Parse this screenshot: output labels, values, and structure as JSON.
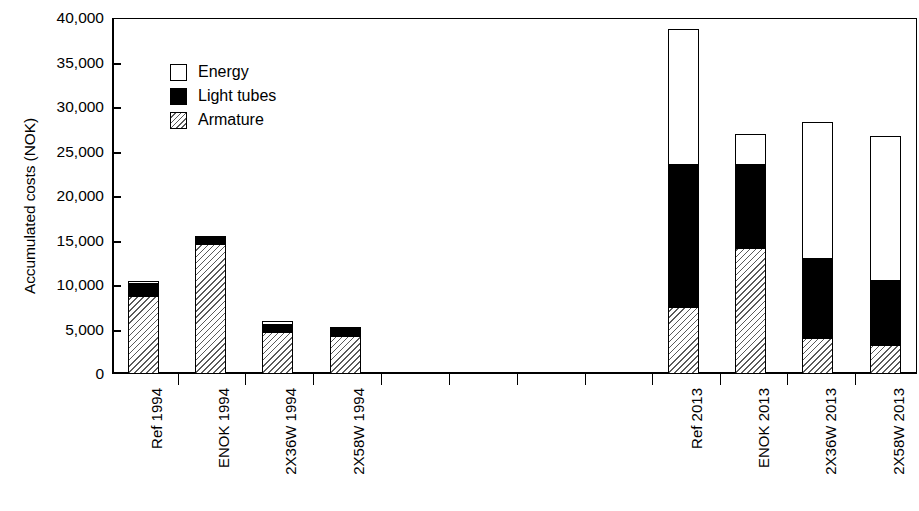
{
  "chart_data": {
    "type": "bar",
    "subtype": "stacked-bar",
    "title": "",
    "xlabel": "",
    "ylabel": "Accumulated costs (NOK)",
    "ylim": [
      0,
      40000
    ],
    "ytick_labels": [
      "40,000",
      "35,000",
      "30,000",
      "25,000",
      "20,000",
      "15,000",
      "10,000",
      "5,000",
      "0"
    ],
    "ytick_values": [
      40000,
      35000,
      30000,
      25000,
      20000,
      15000,
      10000,
      5000,
      0
    ],
    "grid": false,
    "legend_position": "upper-left-inside",
    "categories": [
      "Ref 1994",
      "ENOK 1994",
      "2X36W 1994",
      "2X58W 1994",
      "Ref 2013",
      "ENOK 2013",
      "2X36W 2013",
      "2X58W 2013"
    ],
    "series": [
      {
        "name": "Armature",
        "fill": "hatched",
        "values": [
          8800,
          14600,
          4700,
          4300,
          7500,
          14200,
          4000,
          3300
        ]
      },
      {
        "name": "Light tubes",
        "fill": "black",
        "values": [
          1300,
          900,
          800,
          800,
          16000,
          9300,
          8900,
          7200
        ]
      },
      {
        "name": "Energy",
        "fill": "white",
        "values": [
          400,
          0,
          400,
          200,
          15300,
          3500,
          15400,
          16200
        ]
      }
    ],
    "totals": [
      10500,
      15500,
      5900,
      5300,
      38800,
      27000,
      28300,
      26700
    ]
  },
  "axis": {
    "ylabel": "Accumulated costs (NOK)",
    "ticks": [
      {
        "label": "40,000",
        "value": 40000
      },
      {
        "label": "35,000",
        "value": 35000
      },
      {
        "label": "30,000",
        "value": 30000
      },
      {
        "label": "25,000",
        "value": 25000
      },
      {
        "label": "20,000",
        "value": 20000
      },
      {
        "label": "15,000",
        "value": 15000
      },
      {
        "label": "10,000",
        "value": 10000
      },
      {
        "label": "5,000",
        "value": 5000
      },
      {
        "label": "0",
        "value": 0
      }
    ]
  },
  "legend": {
    "items": [
      {
        "label": "Energy",
        "style": "energy"
      },
      {
        "label": "Light tubes",
        "style": "tubes"
      },
      {
        "label": "Armature",
        "style": "armature"
      }
    ]
  },
  "xlabels": [
    "Ref 1994",
    "ENOK 1994",
    "2X36W 1994",
    "2X58W 1994",
    "Ref 2013",
    "ENOK 2013",
    "2X36W 2013",
    "2X58W 2013"
  ]
}
